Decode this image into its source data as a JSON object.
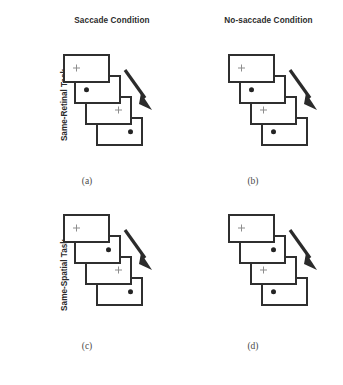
{
  "figure": {
    "column_headings": [
      {
        "id": "saccade",
        "label": "Saccade Condition"
      },
      {
        "id": "no-saccade",
        "label": "No-saccade Condition"
      }
    ],
    "row_labels": [
      {
        "id": "same-retinal",
        "label": "Same-Retinal Task"
      },
      {
        "id": "same-spatial",
        "label": "Same-Spatial Task"
      }
    ],
    "captions": {
      "a": "(a)",
      "b": "(b)",
      "c": "(c)",
      "d": "(d)"
    },
    "colors": {
      "card_border": "#2f2f2f",
      "card_fill": "#ffffff",
      "dot": "#242424",
      "cross": "#8d8d8d",
      "arrow": "#2b2b2b",
      "heading_text": "#2b2b2b",
      "caption_text": "#4a4a4a",
      "background": "#ffffff"
    },
    "icons": {
      "fixation_cross": "plus-cross-icon",
      "target_dot": "filled-circle-icon",
      "time_arrow": "diagonal-arrow-down-right-icon"
    },
    "panels": [
      {
        "id": "a",
        "row": "Same-Retinal Task",
        "condition": "Saccade Condition",
        "caption": "(a)",
        "frames": [
          {
            "marker": "cross",
            "position": "left"
          },
          {
            "marker": "dot",
            "position": "left"
          },
          {
            "marker": "cross",
            "position": "right"
          },
          {
            "marker": "dot",
            "position": "right"
          }
        ]
      },
      {
        "id": "b",
        "row": "Same-Retinal Task",
        "condition": "No-saccade Condition",
        "caption": "(b)",
        "frames": [
          {
            "marker": "cross",
            "position": "left"
          },
          {
            "marker": "dot",
            "position": "left"
          },
          {
            "marker": "cross",
            "position": "left"
          },
          {
            "marker": "dot",
            "position": "left"
          }
        ]
      },
      {
        "id": "c",
        "row": "Same-Spatial Task",
        "condition": "Saccade Condition",
        "caption": "(c)",
        "frames": [
          {
            "marker": "cross",
            "position": "left"
          },
          {
            "marker": "dot",
            "position": "right"
          },
          {
            "marker": "cross",
            "position": "right"
          },
          {
            "marker": "dot",
            "position": "right"
          }
        ]
      },
      {
        "id": "d",
        "row": "Same-Spatial Task",
        "condition": "No-saccade Condition",
        "caption": "(d)",
        "frames": [
          {
            "marker": "cross",
            "position": "left"
          },
          {
            "marker": "dot",
            "position": "right"
          },
          {
            "marker": "cross",
            "position": "left"
          },
          {
            "marker": "dot",
            "position": "left"
          }
        ]
      }
    ]
  }
}
